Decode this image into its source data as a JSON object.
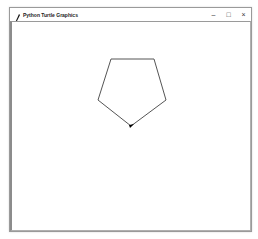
{
  "window": {
    "title": "Python Turtle Graphics",
    "app_icon": "feather-icon",
    "controls": {
      "minimize": "–",
      "maximize": "□",
      "close": "×"
    }
  },
  "canvas": {
    "background": "#ffffff",
    "shape": {
      "type": "pentagon",
      "stroke": "#555555",
      "points": [
        [
          111,
          59
        ],
        [
          154,
          59
        ],
        [
          166,
          100
        ],
        [
          131,
          126
        ],
        [
          98,
          100
        ]
      ]
    },
    "turtle": {
      "shape": "arrow",
      "position": [
        131,
        126
      ],
      "color": "#000000"
    }
  }
}
